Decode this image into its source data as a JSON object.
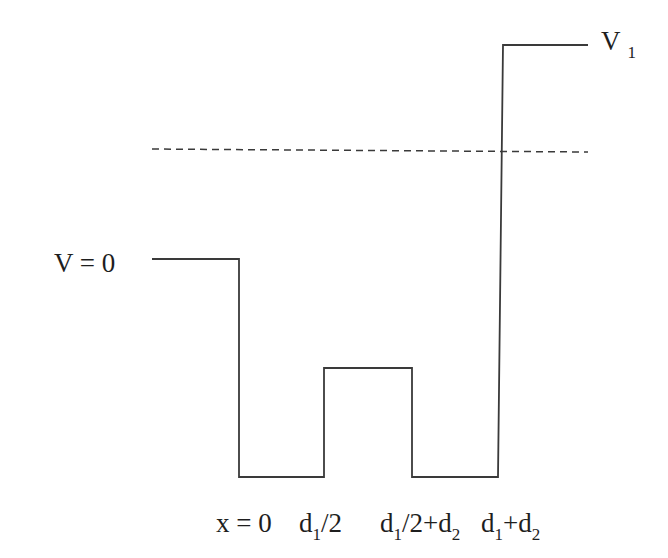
{
  "diagram": {
    "type": "potential-well-profile",
    "stroke_color": "#3a3a3a",
    "dashed_color": "#3a3a3a",
    "background": "#ffffff",
    "potential_profile_points": [
      [
        152,
        259
      ],
      [
        239,
        259
      ],
      [
        239,
        477
      ],
      [
        324,
        477
      ],
      [
        324,
        368
      ],
      [
        412,
        368
      ],
      [
        412,
        477
      ],
      [
        498,
        477
      ],
      [
        503,
        45
      ],
      [
        588,
        45
      ]
    ],
    "energy_level_dashed": {
      "x1": 152,
      "y1": 149,
      "x2": 588,
      "y2": 152
    },
    "labels": {
      "v1": {
        "main": "V",
        "sub": "1"
      },
      "v0": {
        "text": "V = 0"
      },
      "x0": {
        "text": "x = 0"
      },
      "d1_half": {
        "pre": "d",
        "sub1": "1",
        "post": "/2"
      },
      "d1_half_plus_d2": {
        "pre": "d",
        "sub1": "1",
        "mid": "/2+d",
        "sub2": "2"
      },
      "d1_plus_d2": {
        "pre": "d",
        "sub1": "1",
        "mid": "+d",
        "sub2": "2"
      }
    }
  }
}
